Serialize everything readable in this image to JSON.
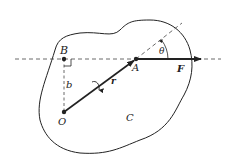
{
  "diagram": {
    "labels": {
      "B": "B",
      "A": "A",
      "F": "F",
      "theta": "θ",
      "b": "b",
      "r": "r",
      "O": "O",
      "C": "C"
    },
    "points": {
      "B": [
        64,
        59
      ],
      "A": [
        136,
        59
      ],
      "O": [
        64,
        112
      ]
    },
    "colors": {
      "stroke": "#222222",
      "background": "#ffffff"
    }
  }
}
